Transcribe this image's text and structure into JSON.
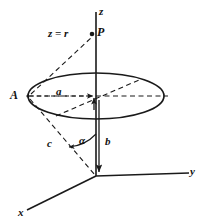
{
  "figure": {
    "background_color": "#ffffff",
    "stroke_color": "#1a1a1a",
    "labels": {
      "axis_z": "z",
      "axis_y": "y",
      "axis_x": "x",
      "point_p": "P",
      "point_a": "A",
      "equation_z_equals_r": "z = r",
      "segment_a": "a",
      "segment_b": "b",
      "segment_c": "c",
      "angle_alpha": "α"
    },
    "geometry": {
      "origin": {
        "x": 96,
        "y": 176
      },
      "point_p": {
        "x": 96,
        "y": 34
      },
      "point_a": {
        "x": 28,
        "y": 96
      },
      "ellipse_center": {
        "x": 96,
        "y": 96
      },
      "ellipse_rx": 68,
      "ellipse_ry": 23,
      "z_axis_top": {
        "x": 96,
        "y": 12
      },
      "y_axis_end": {
        "x": 190,
        "y": 176
      },
      "x_axis_end": {
        "x": 25,
        "y": 212
      }
    }
  }
}
